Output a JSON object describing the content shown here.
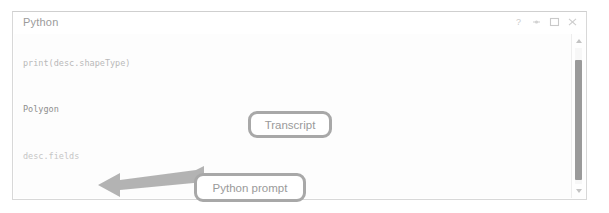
{
  "panel": {
    "title": "Python",
    "window_controls": [
      {
        "name": "help-icon",
        "glyph": "?"
      },
      {
        "name": "pin-icon",
        "glyph": "•"
      },
      {
        "name": "maximize-icon",
        "glyph": "□"
      },
      {
        "name": "close-icon",
        "glyph": "✕"
      }
    ]
  },
  "transcript": {
    "lines": [
      {
        "text": "desc = arcpy.Describe('Fire Boundaries')",
        "kind": "input"
      },
      {
        "text": "print(desc.shapeType)",
        "kind": "input"
      },
      {
        "text": "Polygon",
        "kind": "output"
      },
      {
        "text": "desc.fields",
        "kind": "prompt"
      }
    ]
  },
  "scrollbar": {
    "up_arrow": "scroll-up",
    "down_arrow": "scroll-down"
  },
  "annotations": {
    "transcript_label": "Transcript",
    "python_prompt_label": "Python prompt"
  },
  "colors": {
    "panel_border": "#d8d8d8",
    "title_text": "#9b9b9b",
    "code_text": "#b9b9b9",
    "output_text": "#8e8e8e",
    "callout_border": "#a8a8a8",
    "callout_text": "#9a9a9a",
    "arrow_fill": "#a6a6a6",
    "scrollbar_thumb": "#9a9a9a"
  }
}
